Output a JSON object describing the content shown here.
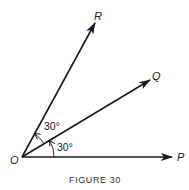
{
  "figure": {
    "caption": "FIGURE 30",
    "origin": {
      "label": "O",
      "x": 22,
      "y": 157
    },
    "rays": [
      {
        "name": "P",
        "label": "P",
        "angle_deg": 0,
        "tip": [
          172,
          157
        ],
        "label_pos": [
          177,
          161
        ]
      },
      {
        "name": "Q",
        "label": "Q",
        "angle_deg": 30,
        "tip": [
          150,
          80
        ],
        "label_pos": [
          152,
          80
        ]
      },
      {
        "name": "R",
        "label": "R",
        "angle_deg": 60,
        "tip": [
          95,
          23
        ],
        "label_pos": [
          94,
          20
        ]
      }
    ],
    "angles": [
      {
        "between": [
          "P",
          "Q"
        ],
        "label": "30°",
        "label_pos": [
          57,
          151
        ]
      },
      {
        "between": [
          "Q",
          "R"
        ],
        "label": "30°",
        "label_pos": [
          44,
          130
        ]
      }
    ],
    "colors": {
      "line": "#1a1a1a",
      "background": "#ffffff"
    }
  }
}
